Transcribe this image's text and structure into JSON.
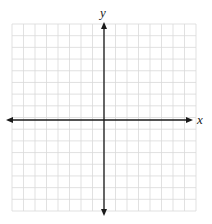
{
  "diagram": {
    "type": "coordinate-plane",
    "grid": {
      "columns": 16,
      "rows": 16,
      "left": 12,
      "top": 24,
      "right": 196,
      "bottom": 211,
      "color": "#d9d9d9"
    },
    "axes": {
      "color": "#1a1a1a",
      "origin_px": [
        104,
        120
      ],
      "x_axis": {
        "label": "x",
        "from_x": 6,
        "to_x": 193,
        "y": 120
      },
      "y_axis": {
        "label": "y",
        "x": 104,
        "from_y": 22,
        "to_y": 216
      }
    }
  }
}
